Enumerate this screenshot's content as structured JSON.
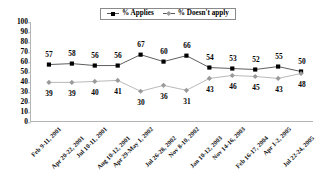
{
  "chart_data": {
    "type": "line",
    "title": "",
    "xlabel": "",
    "ylabel": "",
    "ylim": [
      0,
      100
    ],
    "ytick_step": 10,
    "yticks": [
      "100",
      "90",
      "80",
      "70",
      "60",
      "50",
      "40",
      "30",
      "20",
      "10",
      "0"
    ],
    "grid": false,
    "legend_position": "top-center",
    "categories": [
      "Feb 9-11, 2001",
      "Apr 20-22, 2001",
      "Jul 10-11, 2001",
      "Aug 10-12, 2001",
      "Apr 29-May 1, 2002",
      "Jul 26-28, 2002",
      "Nov 8-10, 2002",
      "Jan 10-12, 2003",
      "Nov 14-16, 2003",
      "Feb 16-17, 2004",
      "Apr 1-2, 2005",
      "Jul 22-24, 2005"
    ],
    "series": [
      {
        "name": "% Applies",
        "marker": "square",
        "color": "#000000",
        "values": [
          57,
          58,
          56,
          56,
          67,
          60,
          66,
          54,
          53,
          52,
          55,
          50
        ],
        "label_side": [
          "above",
          "above",
          "above",
          "above",
          "above",
          "above",
          "above",
          "above",
          "above",
          "above",
          "above",
          "above"
        ]
      },
      {
        "name": "% Doesn't apply",
        "marker": "diamond",
        "color": "#9a9a9a",
        "values": [
          39,
          39,
          40,
          41,
          30,
          36,
          31,
          43,
          46,
          45,
          43,
          48
        ],
        "label_side": [
          "below",
          "below",
          "below",
          "below",
          "below",
          "below",
          "below",
          "below",
          "below",
          "below",
          "below",
          "below"
        ]
      }
    ]
  },
  "legend": {
    "items": [
      {
        "label": "% Applies",
        "marker": "square"
      },
      {
        "label": "% Doesn't apply",
        "marker": "diamond"
      }
    ]
  }
}
